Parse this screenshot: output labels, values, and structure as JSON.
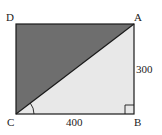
{
  "diagram": {
    "type": "geometry",
    "shape": "rectangle ABCD with diagonal CA",
    "vertices": {
      "D": {
        "label": "D"
      },
      "A": {
        "label": "A"
      },
      "C": {
        "label": "C"
      },
      "B": {
        "label": "B"
      }
    },
    "dimensions": {
      "CB": "400",
      "AB": "300"
    },
    "regions": {
      "upper_triangle_ACD": {
        "fill": "#6e6e6e"
      },
      "lower_triangle_ABC": {
        "fill": "#e8e8e8"
      }
    },
    "markers": {
      "right_angle_at": "B",
      "angle_arc_at": "C"
    },
    "colors": {
      "stroke": "#1a1a1a",
      "dark_fill": "#6e6e6e",
      "light_fill": "#e8e8e8"
    }
  }
}
